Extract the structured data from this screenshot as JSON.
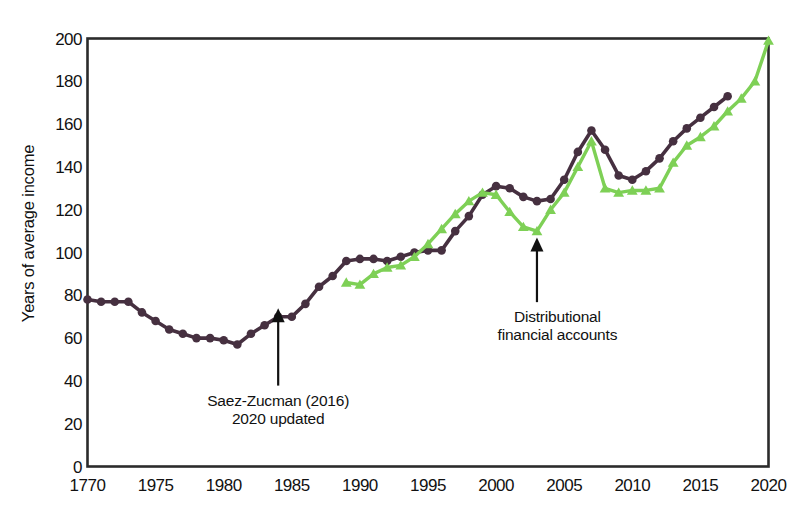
{
  "chart_data": {
    "type": "line",
    "title": "",
    "xlabel": "",
    "ylabel": "Years of average income",
    "xlim": [
      1970,
      2020
    ],
    "ylim": [
      0,
      200
    ],
    "grid": false,
    "legend_position": "none",
    "x_ticks": [
      "1770",
      "1975",
      "1980",
      "1985",
      "1990",
      "1995",
      "2000",
      "2005",
      "2010",
      "2015",
      "2020"
    ],
    "x_tick_values": [
      1970,
      1975,
      1980,
      1985,
      1990,
      1995,
      2000,
      2005,
      2010,
      2015,
      2020
    ],
    "y_ticks": [
      "0",
      "20",
      "40",
      "60",
      "80",
      "100",
      "120",
      "140",
      "160",
      "180",
      "200"
    ],
    "y_tick_values": [
      0,
      20,
      40,
      60,
      80,
      100,
      120,
      140,
      160,
      180,
      200
    ],
    "series": [
      {
        "name": "Saez-Zucman (2016) 2020 updated",
        "color": "#463040",
        "marker": "circle",
        "x": [
          1970,
          1971,
          1972,
          1973,
          1974,
          1975,
          1976,
          1977,
          1978,
          1979,
          1980,
          1981,
          1982,
          1983,
          1984,
          1985,
          1986,
          1987,
          1988,
          1989,
          1990,
          1991,
          1992,
          1993,
          1994,
          1995,
          1996,
          1997,
          1998,
          1999,
          2000,
          2001,
          2002,
          2003,
          2004,
          2005,
          2006,
          2007,
          2008,
          2009,
          2010,
          2011,
          2012,
          2013,
          2014,
          2015,
          2016,
          2017
        ],
        "values": [
          78,
          77,
          77,
          77,
          72,
          68,
          64,
          62,
          60,
          60,
          59,
          57,
          62,
          66,
          70,
          70,
          76,
          84,
          89,
          96,
          97,
          97,
          96,
          98,
          100,
          101,
          101,
          110,
          117,
          127,
          131,
          130,
          126,
          124,
          125,
          134,
          147,
          157,
          148,
          136,
          134,
          138,
          144,
          152,
          158,
          163,
          168,
          173
        ]
      },
      {
        "name": "Distributional financial accounts",
        "color": "#7ed056",
        "marker": "triangle",
        "x": [
          1989,
          1990,
          1991,
          1992,
          1993,
          1994,
          1995,
          1996,
          1997,
          1998,
          1999,
          2000,
          2001,
          2002,
          2003,
          2004,
          2005,
          2006,
          2007,
          2008,
          2009,
          2010,
          2011,
          2012,
          2013,
          2014,
          2015,
          2016,
          2017,
          2018,
          2019,
          2020
        ],
        "values": [
          86,
          85,
          90,
          93,
          94,
          98,
          104,
          111,
          118,
          124,
          128,
          127,
          119,
          112,
          110,
          120,
          128,
          140,
          152,
          130,
          128,
          129,
          129,
          130,
          142,
          150,
          154,
          159,
          166,
          172,
          180,
          199
        ]
      }
    ],
    "annotations": [
      {
        "id": "saez-zucman",
        "lines": [
          "Saez-Zucman (2016)",
          "2020 updated"
        ],
        "arrow_target_x": 1984,
        "arrow_target_y": 74,
        "text_x": 1984,
        "text_y": 35
      },
      {
        "id": "distributional-financial-accounts",
        "lines": [
          "Distributional",
          "financial accounts"
        ],
        "arrow_target_x": 2003,
        "arrow_target_y": 107,
        "text_x": 2004.5,
        "text_y": 74
      }
    ]
  },
  "style": {
    "axis_color": "#2b2b2b",
    "background": "#ffffff",
    "purple": "#463040",
    "green": "#7ed056"
  }
}
